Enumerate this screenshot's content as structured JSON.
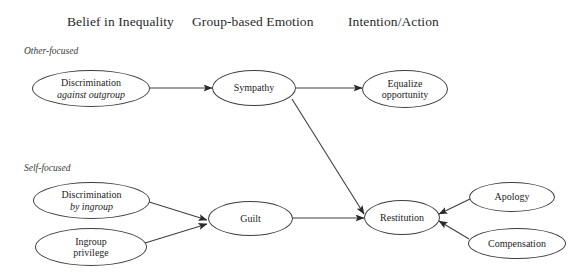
{
  "diagram": {
    "background": "#ffffff",
    "stroke_color": "#3f3f3f",
    "text_color": "#1c1c1c",
    "columns": [
      {
        "id": "col-belief",
        "label": "Belief in Inequality"
      },
      {
        "id": "col-emotion",
        "label": "Group-based Emotion"
      },
      {
        "id": "col-intention",
        "label": "Intention/Action"
      }
    ],
    "section_labels": [
      {
        "id": "other-focused",
        "label": "Other-focused"
      },
      {
        "id": "self-focused",
        "label": "Self-focused"
      }
    ],
    "nodes": [
      {
        "id": "discrimination-against-outgroup",
        "line1": "Discrimination",
        "line2": "against outgroup",
        "line2_italic": true,
        "column": "col-belief",
        "section": "other-focused"
      },
      {
        "id": "sympathy",
        "line1": "Sympathy",
        "line2": "",
        "line2_italic": false,
        "column": "col-emotion",
        "section": "other-focused"
      },
      {
        "id": "equalize-opportunity",
        "line1": "Equalize",
        "line2": "opportunity",
        "line2_italic": false,
        "column": "col-intention",
        "section": "other-focused"
      },
      {
        "id": "discrimination-by-ingroup",
        "line1": "Discrimination",
        "line2": "by ingroup",
        "line2_italic": true,
        "column": "col-belief",
        "section": "self-focused"
      },
      {
        "id": "ingroup-privilege",
        "line1": "Ingroup",
        "line2": "privilege",
        "line2_italic": false,
        "column": "col-belief",
        "section": "self-focused"
      },
      {
        "id": "guilt",
        "line1": "Guilt",
        "line2": "",
        "line2_italic": false,
        "column": "col-emotion",
        "section": "self-focused"
      },
      {
        "id": "restitution",
        "line1": "Restitution",
        "line2": "",
        "line2_italic": false,
        "column": "col-intention",
        "section": "self-focused"
      },
      {
        "id": "apology",
        "line1": "Apology",
        "line2": "",
        "line2_italic": false,
        "column": "col-intention",
        "section": "self-focused"
      },
      {
        "id": "compensation",
        "line1": "Compensation",
        "line2": "",
        "line2_italic": false,
        "column": "col-intention",
        "section": "self-focused"
      }
    ],
    "edges": [
      {
        "id": "edge-discrimination-outgroup-to-sympathy",
        "from": "discrimination-against-outgroup",
        "to": "sympathy",
        "arrow": "to"
      },
      {
        "id": "edge-sympathy-to-equalize-opportunity",
        "from": "sympathy",
        "to": "equalize-opportunity",
        "arrow": "to"
      },
      {
        "id": "edge-sympathy-to-restitution",
        "from": "sympathy",
        "to": "restitution",
        "arrow": "to"
      },
      {
        "id": "edge-discrimination-ingroup-to-guilt",
        "from": "discrimination-by-ingroup",
        "to": "guilt",
        "arrow": "to"
      },
      {
        "id": "edge-ingroup-privilege-to-guilt",
        "from": "ingroup-privilege",
        "to": "guilt",
        "arrow": "to"
      },
      {
        "id": "edge-guilt-to-restitution",
        "from": "guilt",
        "to": "restitution",
        "arrow": "to"
      },
      {
        "id": "edge-apology-to-restitution",
        "from": "apology",
        "to": "restitution",
        "arrow": "to"
      },
      {
        "id": "edge-compensation-to-restitution",
        "from": "compensation",
        "to": "restitution",
        "arrow": "to"
      }
    ]
  }
}
